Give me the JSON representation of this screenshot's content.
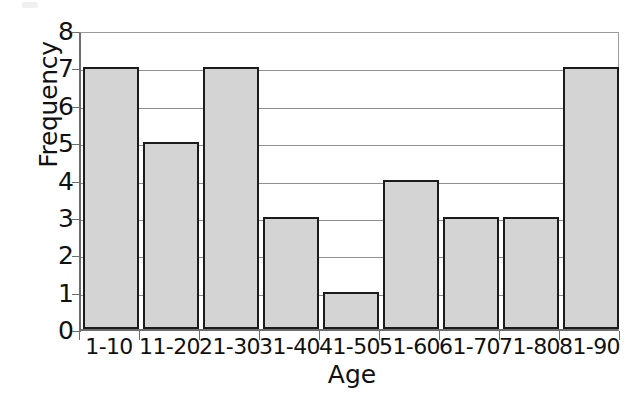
{
  "chart_data": {
    "type": "bar",
    "title": "",
    "subtitle": "",
    "xlabel": "Age",
    "ylabel": "Frequency",
    "categories": [
      "1-10",
      "11-20",
      "21-30",
      "31-40",
      "41-50",
      "51-60",
      "61-70",
      "71-80",
      "81-90"
    ],
    "values": [
      7,
      5,
      7,
      3,
      1,
      4,
      3,
      3,
      7
    ],
    "series": [
      {
        "name": "Frequency",
        "values": [
          7,
          5,
          7,
          3,
          1,
          4,
          3,
          3,
          7
        ]
      }
    ],
    "ylim": [
      0,
      8
    ],
    "y_ticks": [
      0,
      1,
      2,
      3,
      4,
      5,
      6,
      7,
      8
    ],
    "y_tick_labels": [
      "0",
      "1",
      "2",
      "3",
      "4",
      "5",
      "6",
      "7",
      "8"
    ],
    "grid": "horizontal",
    "legend": "none",
    "bar_fill_color": "#d4d4d4",
    "bar_border_color": "#1b1b1b",
    "gridline_color": "#8f8f8f",
    "axis_color": "#6d6d6d",
    "background_color": "#ffffff"
  }
}
